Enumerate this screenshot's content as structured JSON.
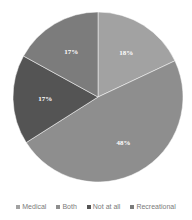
{
  "chart_data": {
    "type": "pie",
    "title": "",
    "categories": [
      "Medical",
      "Both",
      "Not at all",
      "Recreational"
    ],
    "values": [
      18,
      48,
      17,
      17
    ],
    "labels": [
      "18%",
      "48%",
      "17%",
      "17%"
    ],
    "colors": [
      "#a2a2a2",
      "#8e8e8e",
      "#545454",
      "#7c7c7c"
    ],
    "start_angle": "12 o'clock",
    "direction": "clockwise",
    "legend_position": "bottom"
  },
  "legend": {
    "items": [
      {
        "label": "Medical",
        "color": "#a2a2a2"
      },
      {
        "label": "Both",
        "color": "#8e8e8e"
      },
      {
        "label": "Not at all",
        "color": "#545454"
      },
      {
        "label": "Recreational",
        "color": "#7c7c7c"
      }
    ]
  }
}
